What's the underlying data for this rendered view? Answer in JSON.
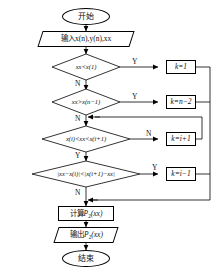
{
  "diagram": {
    "orientation": "top-to-bottom",
    "line_color": "#000000",
    "fill_color": "#ffffff"
  },
  "nodes": {
    "start": {
      "label": "开始",
      "shape": "terminator"
    },
    "input": {
      "label": "输入x(n),y(n),xx",
      "shape": "parallelogram"
    },
    "decision1": {
      "label": "xx<x(1)",
      "shape": "diamond"
    },
    "decision2": {
      "label": "xx>x(n−1)",
      "shape": "diamond"
    },
    "decision3": {
      "label": "x(i)<xx<x(i+1)",
      "shape": "diamond"
    },
    "decision4": {
      "label": "|xx−x(i)|<|x(i+1)−xx|",
      "shape": "diamond"
    },
    "assign1": {
      "label": "k=1",
      "shape": "rectangle"
    },
    "assign2": {
      "label": "k=n−2",
      "shape": "rectangle"
    },
    "assign3": {
      "label": "k=i+1",
      "shape": "rectangle"
    },
    "assign4": {
      "label": "k=i−1",
      "shape": "rectangle"
    },
    "compute": {
      "label_prefix": "计算",
      "label_symbol": "P",
      "label_sub": "2",
      "label_suffix": "(xx)",
      "shape": "rectangle"
    },
    "output": {
      "label_prefix": "输出",
      "label_symbol": "P",
      "label_sub": "2",
      "label_suffix": "(xx)",
      "shape": "parallelogram"
    },
    "end": {
      "label": "结束",
      "shape": "terminator"
    }
  },
  "branch_labels": {
    "d1_yes": "Y",
    "d1_no": "N",
    "d2_yes": "Y",
    "d2_no": "N",
    "d3_no": "N",
    "d3_yes": "Y",
    "d4_yes": "Y",
    "d4_no": "N"
  }
}
